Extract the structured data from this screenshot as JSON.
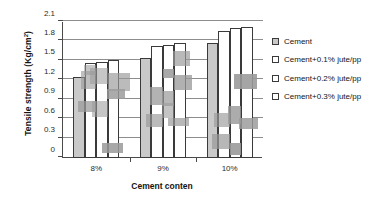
{
  "chart_data": {
    "type": "bar",
    "title": "",
    "xlabel": "Cement conten",
    "ylabel": "Tensile strength (Kg/cm2)",
    "ylabel_unit_sup": "2",
    "ylabel_base": "Tensile strength (Kg/cm",
    "categories": [
      "8%",
      "9%",
      "10%"
    ],
    "series": [
      {
        "name": "Cement",
        "values": [
          1.25,
          1.54,
          1.77
        ]
      },
      {
        "name": "Cement+0.1% jute/pp",
        "values": [
          1.46,
          1.73,
          1.96
        ]
      },
      {
        "name": "Cement+0.2% jute/pp",
        "values": [
          1.49,
          1.74,
          2.0
        ]
      },
      {
        "name": "Cement+0.3% jute/pp",
        "values": [
          1.52,
          1.77,
          2.02
        ]
      }
    ],
    "ylim": [
      0,
      2.1
    ],
    "yticks": [
      "0",
      "0.3",
      "0.6",
      "0.9",
      "1.2",
      "1.5",
      "1.8",
      "2.1"
    ],
    "ytick_values": [
      0,
      0.3,
      0.6,
      0.9,
      1.2,
      1.5,
      1.8,
      2.1
    ],
    "grid": true,
    "legend_position": "right",
    "colors": {
      "series_0_fill": "#c9c9c9",
      "series_1_fill": "#ffffff",
      "series_2_fill": "#ffffff",
      "series_3_fill": "#ffffff",
      "bar_outline": "#3a3a3a",
      "gridline": "#8d8d8d",
      "axis": "#4a4a4a",
      "text": "#141414"
    }
  },
  "legend": {
    "items": [
      {
        "label": "Cement"
      },
      {
        "label": "Cement+0.1% jute/pp"
      },
      {
        "label": "Cement+0.2% jute/pp"
      },
      {
        "label": "Cement+0.3% jute/pp"
      }
    ]
  }
}
